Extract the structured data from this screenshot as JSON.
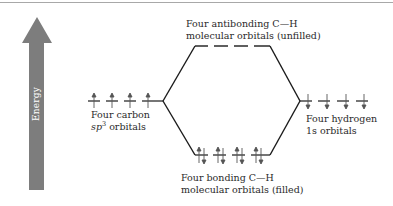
{
  "diagram": {
    "type": "molecular-orbital-energy-diagram",
    "energy_axis": {
      "label": "Energy",
      "direction": "up",
      "color": "#7d7d7d"
    },
    "labels": {
      "antibonding_line1": "Four antibonding C—H",
      "antibonding_line2": "molecular orbitals (unfilled)",
      "carbon_line1": "Four carbon",
      "carbon_sp": "sp",
      "carbon_sup": "3",
      "carbon_rest": " orbitals",
      "hydrogen_line1": "Four hydrogen",
      "hydrogen_line2": "1s orbitals",
      "bonding_line1": "Four bonding C—H",
      "bonding_line2": "molecular orbitals (filled)"
    },
    "levels": {
      "carbon_sp3": {
        "count": 4,
        "electrons": "one up-spin each"
      },
      "hydrogen_1s": {
        "count": 4,
        "electrons": "one down-spin each"
      },
      "bonding": {
        "count": 4,
        "electrons": "paired (up + down) each"
      },
      "antibonding": {
        "count": 4,
        "electrons": "empty"
      }
    },
    "colors": {
      "line": "#1a1a1a",
      "arrow": "#7d7d7d",
      "electron": "#555555"
    }
  }
}
